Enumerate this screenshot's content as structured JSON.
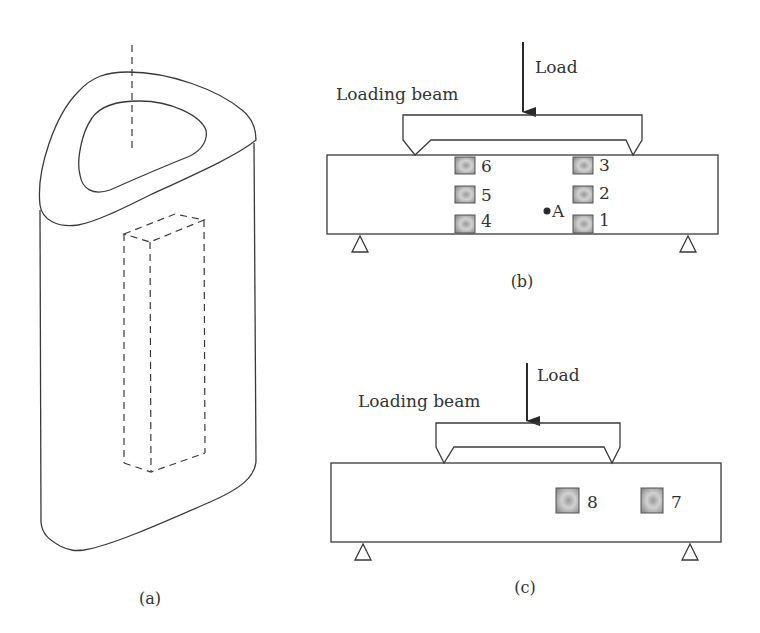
{
  "figure": {
    "panels": [
      {
        "id": "a",
        "caption": "(a)",
        "description": "Isometric view of hollow rounded-triangular column with dashed specimen box and dashed central axis"
      },
      {
        "id": "b",
        "caption": "(b)",
        "load_label": "Load",
        "loading_beam_label": "Loading beam",
        "point_label": "A",
        "sensors": [
          {
            "id": "6",
            "label": "6"
          },
          {
            "id": "5",
            "label": "5"
          },
          {
            "id": "4",
            "label": "4"
          },
          {
            "id": "3",
            "label": "3"
          },
          {
            "id": "2",
            "label": "2"
          },
          {
            "id": "1",
            "label": "1"
          }
        ]
      },
      {
        "id": "c",
        "caption": "(c)",
        "load_label": "Load",
        "loading_beam_label": "Loading beam",
        "sensors": [
          {
            "id": "8",
            "label": "8"
          },
          {
            "id": "7",
            "label": "7"
          }
        ]
      }
    ]
  },
  "colors": {
    "line": "#3a3a3a",
    "sensor_fill": "#b8b8b8",
    "background": "#ffffff"
  }
}
